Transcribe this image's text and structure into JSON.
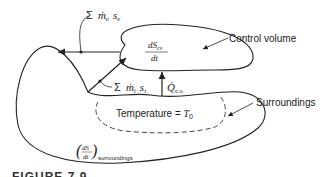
{
  "diagram": {
    "labels": {
      "exit_flow": "Σ ṁe se",
      "exit_sum": "Σ",
      "exit_m": "ṁ",
      "exit_m_sub": "e",
      "exit_s": "s",
      "exit_s_sub": "e",
      "inlet_sum": "Σ",
      "inlet_m": "ṁ",
      "inlet_m_sub": "i",
      "inlet_s": "s",
      "inlet_s_sub": "i",
      "cv_numerator": "dS",
      "cv_numerator_sub": "cv",
      "cv_denominator": "dt",
      "control_volume": "Control volume",
      "heat_q": "Q̇",
      "heat_q_sub": "c.v.",
      "surroundings": "Surroundings",
      "temperature": "Temperature = ",
      "temperature_symbol": "T",
      "temperature_sub": "0",
      "surr_numerator": "dS",
      "surr_denominator": "dt",
      "surr_sub": "surroundings"
    },
    "caption": "FIGURE 7.9"
  }
}
